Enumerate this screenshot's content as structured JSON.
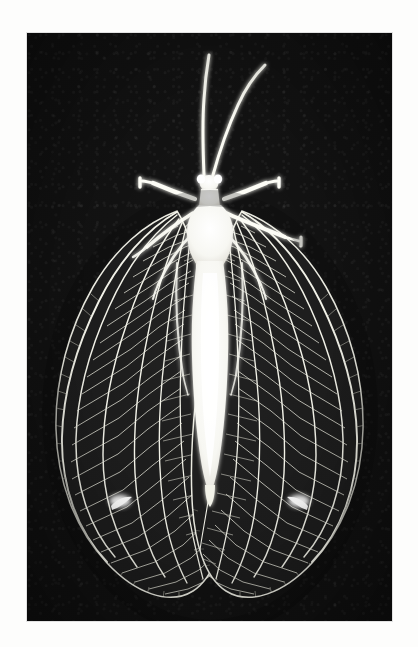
{
  "page": {
    "background_color": "#fdfdfc",
    "plate": {
      "label": "photographic-plate",
      "background_color": "#101010",
      "ink_color": "#f5f5f0",
      "x": 27,
      "y": 33,
      "width": 365,
      "height": 588,
      "rendering": "negative / transmitted-light photograph, white subject on black field",
      "orientation": "dorsal view, head at top, wings spread"
    },
    "subject": {
      "common_name": "lacewing",
      "family": "Chrysopidae",
      "view": "dorsal",
      "parts": [
        {
          "name": "antenna-left",
          "count": 1,
          "description": "long filiform antenna sweeping up and slightly left"
        },
        {
          "name": "antenna-right",
          "count": 1,
          "description": "long filiform antenna sweeping up and to the right"
        },
        {
          "name": "head",
          "count": 1,
          "description": "small rounded head with paired eyes"
        },
        {
          "name": "pronotum",
          "count": 1,
          "description": "short rectangular collar behind head"
        },
        {
          "name": "thorax",
          "count": 1,
          "description": "broad bright thorax bearing wings and legs"
        },
        {
          "name": "abdomen",
          "count": 1,
          "description": "long tapering bright abdomen reaching mid-wing"
        },
        {
          "name": "foreleg-left",
          "count": 1,
          "description": "extends up-left with clubbed tarsus"
        },
        {
          "name": "foreleg-right",
          "count": 1,
          "description": "extends up-right with clubbed tarsus"
        },
        {
          "name": "midleg-right",
          "count": 1,
          "description": "extends right and down with clubbed tarsus"
        },
        {
          "name": "hindleg-left",
          "count": 1,
          "description": "folded beneath left wing base"
        },
        {
          "name": "hindleg-right",
          "count": 1,
          "description": "folded beneath right wing base"
        },
        {
          "name": "forewing-left",
          "count": 1,
          "description": "large ovate wing, dense rectangular cross-vein lattice"
        },
        {
          "name": "forewing-right",
          "count": 1,
          "description": "large ovate wing, dense rectangular cross-vein lattice"
        },
        {
          "name": "hindwing-left",
          "count": 1,
          "description": "narrower wing overlapped by forewing"
        },
        {
          "name": "hindwing-right",
          "count": 1,
          "description": "narrower wing overlapped by forewing"
        },
        {
          "name": "stigma-left",
          "count": 1,
          "description": "bright opaque patch on left wing, lower outer third"
        },
        {
          "name": "stigma-right",
          "count": 1,
          "description": "bright opaque patch on right wing, lower outer third"
        }
      ],
      "wing_venation": {
        "longitudinal_veins_per_wing": 7,
        "cross_vein_rows": 26,
        "marginal_fringe_veinlets": 60,
        "description": "radial sector branching into a dense ladder of quadrangular cells, with a fringe of short marginal veinlets along the outer margin"
      }
    }
  }
}
